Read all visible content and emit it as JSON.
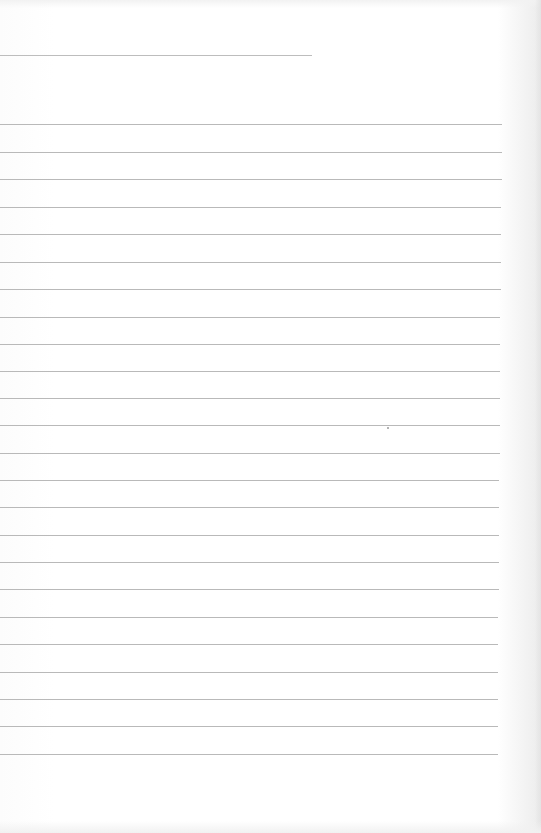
{
  "page": {
    "type": "blank-ruled-paper",
    "background": "#ffffff",
    "line_color": "#b9b9b9"
  },
  "short_rule": {
    "top": 55,
    "width": 312
  },
  "rules": [
    {
      "top": 124,
      "width": 502
    },
    {
      "top": 152,
      "width": 502
    },
    {
      "top": 179,
      "width": 502
    },
    {
      "top": 207,
      "width": 501
    },
    {
      "top": 234,
      "width": 501
    },
    {
      "top": 262,
      "width": 501
    },
    {
      "top": 289,
      "width": 501
    },
    {
      "top": 317,
      "width": 500
    },
    {
      "top": 344,
      "width": 500
    },
    {
      "top": 371,
      "width": 500
    },
    {
      "top": 398,
      "width": 500
    },
    {
      "top": 425,
      "width": 500
    },
    {
      "top": 453,
      "width": 500
    },
    {
      "top": 480,
      "width": 499
    },
    {
      "top": 507,
      "width": 499
    },
    {
      "top": 535,
      "width": 499
    },
    {
      "top": 562,
      "width": 499
    },
    {
      "top": 589,
      "width": 499
    },
    {
      "top": 617,
      "width": 498
    },
    {
      "top": 644,
      "width": 498
    },
    {
      "top": 672,
      "width": 498
    },
    {
      "top": 699,
      "width": 498
    },
    {
      "top": 726,
      "width": 498
    },
    {
      "top": 754,
      "width": 498
    }
  ]
}
